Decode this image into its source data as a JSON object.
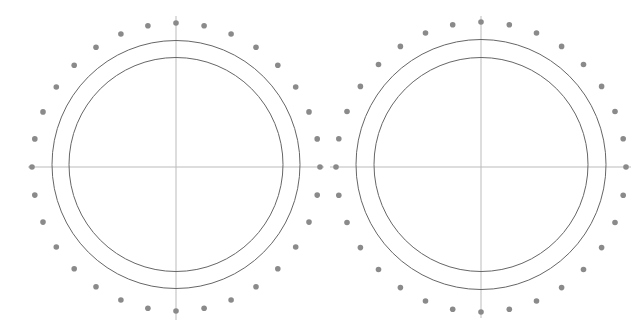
{
  "colors": {
    "background": "#ffffff",
    "axis": "#bbbbbb",
    "circle": "#666666",
    "dot": "#8a8a8a"
  },
  "diagrams": [
    {
      "name": "left-diagram",
      "center": [
        176,
        167
      ],
      "circle_center_y": 164.5,
      "outer_radius": 124,
      "inner_radius": 107,
      "dot_ring_radius": 144,
      "dot_count": 32,
      "dot_radius": 2.8,
      "h_axis": [
        28,
        324
      ],
      "v_axis": [
        16,
        320
      ]
    },
    {
      "name": "right-diagram",
      "center": [
        481,
        167
      ],
      "circle_center_y": 164.5,
      "outer_radius": 125,
      "inner_radius": 107,
      "dot_ring_radius": 145,
      "dot_count": 32,
      "dot_radius": 2.8,
      "h_axis": [
        330,
        631
      ],
      "v_axis": [
        16,
        318
      ]
    }
  ]
}
